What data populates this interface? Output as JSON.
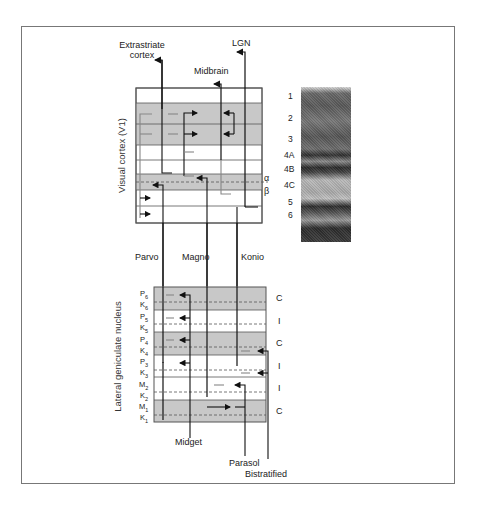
{
  "diagram": {
    "targets": {
      "extrastriate_line1": "Extrastriate",
      "extrastriate_line2": "cortex",
      "midbrain": "Midbrain",
      "lgn": "LGN"
    },
    "v1": {
      "axis_label": "Visual cortex (V1)",
      "sublayer_alpha": "α",
      "sublayer_beta": "β",
      "layers": [
        "1",
        "2",
        "3",
        "4A",
        "4B",
        "4C",
        "5",
        "6"
      ]
    },
    "pathways": {
      "parvo": "Parvo",
      "magno": "Magno",
      "konio": "Konio"
    },
    "lgn": {
      "axis_label": "Lateral geniculate nucleus",
      "layers": [
        {
          "main": "P",
          "sub": "6"
        },
        {
          "main": "K",
          "sub": "6"
        },
        {
          "main": "P",
          "sub": "5"
        },
        {
          "main": "K",
          "sub": "5"
        },
        {
          "main": "P",
          "sub": "4"
        },
        {
          "main": "K",
          "sub": "4"
        },
        {
          "main": "P",
          "sub": "3"
        },
        {
          "main": "K",
          "sub": "3"
        },
        {
          "main": "M",
          "sub": "2"
        },
        {
          "main": "K",
          "sub": "2"
        },
        {
          "main": "M",
          "sub": "1"
        },
        {
          "main": "K",
          "sub": "1"
        }
      ],
      "eye_labels": [
        "C",
        "I",
        "C",
        "I",
        "I",
        "C"
      ]
    },
    "retinal_cells": {
      "midget": "Midget",
      "parasol": "Parasol",
      "bistratified": "Bistratified"
    },
    "colors": {
      "shade": "#c8c8c8",
      "line": "#111111",
      "box_border": "#555555"
    }
  }
}
